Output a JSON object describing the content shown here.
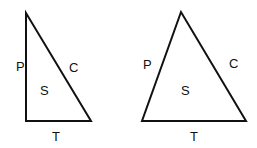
{
  "diagram": {
    "background": "#ffffff",
    "stroke_color": "#111111",
    "triangles": [
      {
        "name": "right-triangle",
        "points": "26,13 26,121 91,121",
        "labels": {
          "P": {
            "text": "P",
            "x": 16,
            "y": 71
          },
          "C": {
            "text": "C",
            "x": 69,
            "y": 72
          },
          "S": {
            "text": "S",
            "x": 40,
            "y": 95
          },
          "T": {
            "text": "T",
            "x": 52,
            "y": 141
          }
        }
      },
      {
        "name": "scalene-triangle",
        "points": "181,12 142,121 246,121",
        "labels": {
          "P": {
            "text": "P",
            "x": 143,
            "y": 69
          },
          "C": {
            "text": "C",
            "x": 229,
            "y": 68
          },
          "S": {
            "text": "S",
            "x": 181,
            "y": 95
          },
          "T": {
            "text": "T",
            "x": 190,
            "y": 141
          }
        }
      }
    ]
  }
}
